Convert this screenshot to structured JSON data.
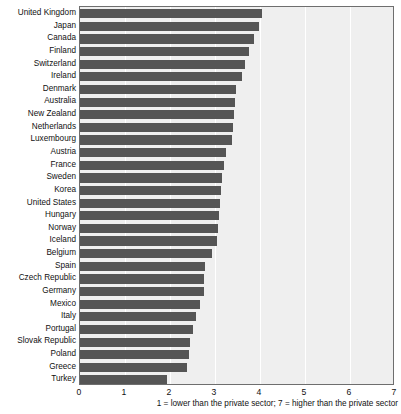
{
  "chart_data": {
    "type": "bar",
    "orientation": "horizontal",
    "title": "",
    "xlabel": "1 = lower than the private sector; 7 = higher than the private sector",
    "ylabel": "",
    "xlim": [
      0,
      7
    ],
    "xticks": [
      0,
      1,
      2,
      3,
      4,
      5,
      6,
      7
    ],
    "xtick_labels": [
      "0",
      "1",
      "2",
      "3",
      "4",
      "5",
      "6",
      "7"
    ],
    "grid": true,
    "grid_axis": "x",
    "legend": "none",
    "bar_color": "#555555",
    "plot_background": "#efefef",
    "gridline_color": "#ffffff",
    "categories": [
      "United Kingdom",
      "Japan",
      "Canada",
      "Finland",
      "Switzerland",
      "Ireland",
      "Denmark",
      "Australia",
      "New Zealand",
      "Netherlands",
      "Luxembourg",
      "Austria",
      "France",
      "Sweden",
      "Korea",
      "United States",
      "Hungary",
      "Norway",
      "Iceland",
      "Belgium",
      "Spain",
      "Czech Republic",
      "Germany",
      "Mexico",
      "Italy",
      "Portugal",
      "Slovak Republic",
      "Poland",
      "Greece",
      "Turkey"
    ],
    "values": [
      4.05,
      3.98,
      3.87,
      3.76,
      3.67,
      3.6,
      3.47,
      3.44,
      3.42,
      3.4,
      3.38,
      3.24,
      3.2,
      3.16,
      3.13,
      3.11,
      3.09,
      3.07,
      3.04,
      2.93,
      2.78,
      2.76,
      2.75,
      2.67,
      2.58,
      2.51,
      2.44,
      2.42,
      2.38,
      1.93
    ]
  },
  "axis": {
    "note": "1 = lower than the private sector; 7 = higher than the private sector"
  }
}
